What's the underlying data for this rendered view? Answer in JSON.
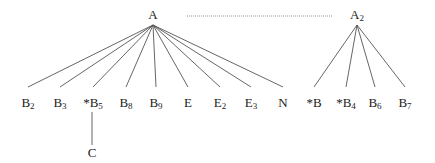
{
  "diagram": {
    "type": "tree",
    "colors": {
      "line": "#555555",
      "text": "#222222",
      "dotted": "#777777",
      "background": "#ffffff"
    },
    "roots": [
      {
        "id": "A",
        "label": "A",
        "sub": "",
        "x": 153,
        "y": 19,
        "apex_y": 25
      },
      {
        "id": "A2",
        "label": "A",
        "sub": "2",
        "x": 357,
        "y": 19,
        "apex_y": 25
      }
    ],
    "dotted_link": {
      "from": "A",
      "to": "A2",
      "x1": 187,
      "x2": 332,
      "y": 16
    },
    "leaves": [
      {
        "id": "B2",
        "parent": "A",
        "label": "B",
        "sub": "2",
        "x": 28
      },
      {
        "id": "B3",
        "parent": "A",
        "label": "B",
        "sub": "3",
        "x": 60
      },
      {
        "id": "B5",
        "parent": "A",
        "label": "*B",
        "sub": "5",
        "x": 93
      },
      {
        "id": "B8",
        "parent": "A",
        "label": "B",
        "sub": "8",
        "x": 126
      },
      {
        "id": "B9",
        "parent": "A",
        "label": "B",
        "sub": "9",
        "x": 156
      },
      {
        "id": "E",
        "parent": "A",
        "label": "E",
        "sub": "",
        "x": 188
      },
      {
        "id": "E2",
        "parent": "A",
        "label": "E",
        "sub": "2",
        "x": 220
      },
      {
        "id": "E3",
        "parent": "A",
        "label": "E",
        "sub": "3",
        "x": 251
      },
      {
        "id": "N",
        "parent": "A",
        "label": "N",
        "sub": "",
        "x": 283
      },
      {
        "id": "B",
        "parent": "A2",
        "label": "*B",
        "sub": "",
        "x": 314
      },
      {
        "id": "B4",
        "parent": "A2",
        "label": "*B",
        "sub": "4",
        "x": 346
      },
      {
        "id": "B6",
        "parent": "A2",
        "label": "B",
        "sub": "6",
        "x": 375
      },
      {
        "id": "B7",
        "parent": "A2",
        "label": "B",
        "sub": "7",
        "x": 405
      }
    ],
    "leaf_label_y": 107,
    "leaf_edge_end_y": 87,
    "children": [
      {
        "id": "C",
        "parent": "B5",
        "label": "C",
        "sub": "",
        "x": 92,
        "y": 157,
        "edge_top": 112,
        "edge_bottom": 145
      }
    ]
  }
}
